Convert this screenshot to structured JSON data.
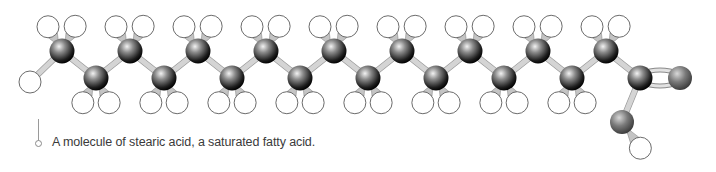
{
  "figure": {
    "caption": "A molecule of stearic acid, a saturated fatty acid.",
    "subject": "stearic acid"
  },
  "colors": {
    "carbon_dark": "#1a1a1a",
    "carbon_light": "#e8e8e8",
    "oxygen": "#7a7a7a",
    "hydrogen_fill": "#ffffff",
    "hydrogen_stroke": "#555555",
    "bond": "#c8c8c8",
    "caption_text": "#3a3a3a"
  },
  "molecule": {
    "carbons_upper": [
      [
        62,
        51
      ],
      [
        130,
        51
      ],
      [
        198,
        51
      ],
      [
        266,
        51
      ],
      [
        334,
        51
      ],
      [
        402,
        51
      ],
      [
        470,
        51
      ],
      [
        538,
        51
      ],
      [
        606,
        51
      ]
    ],
    "carbons_lower": [
      [
        96,
        78
      ],
      [
        164,
        78
      ],
      [
        232,
        78
      ],
      [
        300,
        78
      ],
      [
        368,
        78
      ],
      [
        436,
        78
      ],
      [
        504,
        78
      ],
      [
        572,
        78
      ]
    ],
    "carboxyl_carbon": [
      640,
      78
    ],
    "oxygen_double": [
      680,
      78
    ],
    "oxygen_hydroxyl": [
      622,
      122
    ],
    "hydrogen_hydroxyl": [
      660,
      148
    ],
    "terminal_hydrogen": [
      30,
      82
    ]
  }
}
